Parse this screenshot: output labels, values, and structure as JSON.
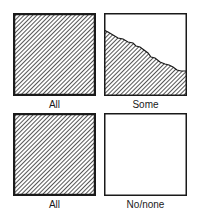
{
  "figure": {
    "panels": [
      {
        "label": "All",
        "fill": "full"
      },
      {
        "label": "Some",
        "fill": "partial"
      },
      {
        "label": "All",
        "fill": "full"
      },
      {
        "label": "No/none",
        "fill": "empty"
      }
    ],
    "colors": {
      "stroke": "#1a1a1a",
      "hatch": "#2a2a2a",
      "background": "#ffffff"
    }
  }
}
